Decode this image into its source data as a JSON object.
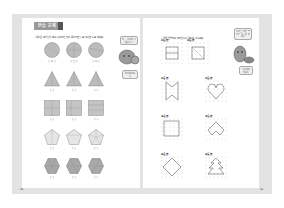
{
  "left_page": {
    "tab_label": "연습 문제",
    "instruction": "• 똑같은 모양인지 보고, 나뉘어진 칸이 똑같으면 ○표, 아니면 ×표 하세요.",
    "bubble_top": "모두 똑같이 나뉘었나요?",
    "bubble_bottom": "잘 살펴보세요!",
    "rows": [
      {
        "shape": "circle",
        "answers": [
          "( × )",
          "( ○ )",
          "( × )"
        ]
      },
      {
        "shape": "triangle",
        "answers": [
          "(   )",
          "(   )",
          "(   )"
        ]
      },
      {
        "shape": "square",
        "answers": [
          "(   )",
          "(   )",
          "(   )"
        ]
      },
      {
        "shape": "pentagon",
        "answers": [
          "(   )",
          "(   )",
          "(   )"
        ]
      },
      {
        "shape": "hexagon",
        "answers": [
          "(   )",
          "(   )",
          "(   )"
        ]
      }
    ],
    "page_number": "48"
  },
  "right_page": {
    "instruction": "• 점을 연결하여 주어진 수로 똑같이 나누세요.",
    "bubble_top": "똑같은 모양 크기로 나누어 보세요",
    "bubble_bottom": "점을 이어 보세요",
    "grids": [
      {
        "label": "2등분",
        "figure": "square-split"
      },
      {
        "label": "4등분",
        "figure": "square-x"
      },
      {
        "label": "2등분",
        "figure": "ribbon"
      },
      {
        "label": "2등분",
        "figure": "heart"
      },
      {
        "label": "3등분",
        "figure": "square"
      },
      {
        "label": "3등분",
        "figure": "arrow"
      },
      {
        "label": "4등분",
        "figure": "diamond"
      },
      {
        "label": "4등분",
        "figure": "tree"
      }
    ],
    "page_number": "49"
  },
  "colors": {
    "tab": "#9a9a9a",
    "frame": "#e3e3e3",
    "shape_fill": "#b8b8b8",
    "line": "#555555"
  }
}
